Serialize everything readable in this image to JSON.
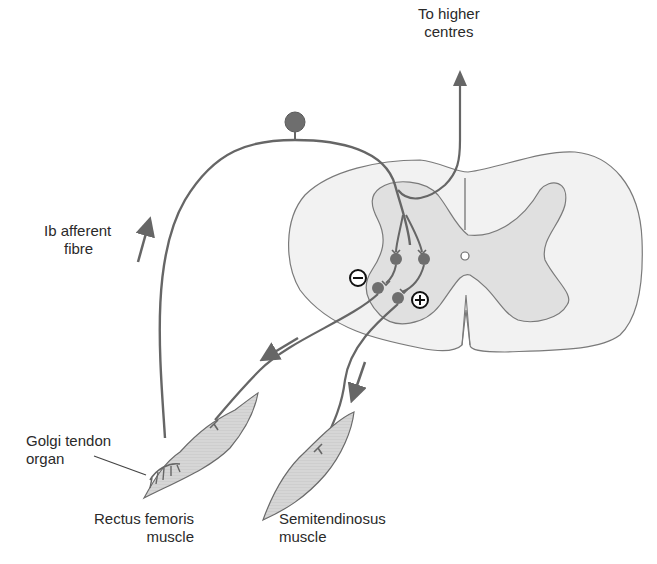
{
  "diagram": {
    "colors": {
      "nerve": "#666666",
      "cord_outline": "#7a7a7a",
      "white_matter": "#f2f2f2",
      "grey_matter": "#e0e0e0",
      "muscle_fill": "#d4d4d4",
      "neuron_body": "#6e6e6e",
      "sign_outline": "#111111"
    },
    "labels": {
      "higher_centres": {
        "line1": "To higher",
        "line2": "centres"
      },
      "afferent": {
        "line1": "Ib afferent",
        "line2": "fibre"
      },
      "golgi": {
        "line1": "Golgi tendon",
        "line2": "organ"
      },
      "rectus": {
        "line1": "Rectus femoris",
        "line2": "muscle"
      },
      "semitendinosus": {
        "line1": "Semitendinosus",
        "line2": "muscle"
      }
    },
    "signs": {
      "inhibitory": "−",
      "excitatory": "+"
    }
  }
}
